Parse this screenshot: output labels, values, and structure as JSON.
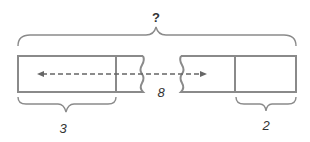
{
  "diagram": {
    "type": "tape-diagram",
    "total_label": "?",
    "left_segment_label": "3",
    "middle_label": "8",
    "right_segment_label": "2",
    "colors": {
      "stroke": "#8a8a8a",
      "text": "#333333",
      "arrow": "#666666"
    }
  }
}
